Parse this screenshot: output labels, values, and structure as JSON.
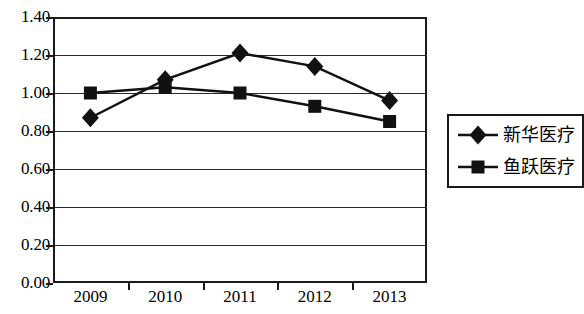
{
  "chart_data": {
    "type": "line",
    "title": "",
    "subtitle": "",
    "xlabel": "",
    "ylabel": "",
    "categories": [
      "2009",
      "2010",
      "2011",
      "2012",
      "2013"
    ],
    "series": [
      {
        "name": "新华医疗",
        "marker": "diamond",
        "values": [
          0.87,
          1.07,
          1.21,
          1.14,
          0.96
        ]
      },
      {
        "name": "鱼跃医疗",
        "marker": "square",
        "values": [
          1.0,
          1.03,
          1.0,
          0.93,
          0.85
        ]
      }
    ],
    "ylim": [
      0.0,
      1.4
    ],
    "ytick_labels": [
      "0.00",
      "0.20",
      "0.40",
      "0.60",
      "0.80",
      "1.00",
      "1.20",
      "1.40"
    ],
    "ytick_values": [
      0.0,
      0.2,
      0.4,
      0.6,
      0.8,
      1.0,
      1.2,
      1.4
    ],
    "grid": true,
    "grid_axis": "y",
    "legend_position": "right",
    "line_color": "#111111",
    "marker_color": "#111111",
    "grid_color": "#2b2b2b",
    "frame_color": "#1a1a1a",
    "background_color": "#ffffff"
  },
  "legend": {
    "entries": [
      {
        "label": "新华医疗",
        "marker": "diamond"
      },
      {
        "label": "鱼跃医疗",
        "marker": "square"
      }
    ]
  }
}
